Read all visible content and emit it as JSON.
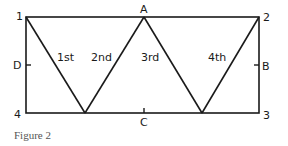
{
  "figure": {
    "caption": "Figure 2",
    "colors": {
      "stroke": "#1a1a1a",
      "caption": "#555555",
      "background": "#ffffff"
    },
    "corners": [
      {
        "label": "1",
        "x": 26,
        "y": 17
      },
      {
        "label": "2",
        "x": 259,
        "y": 17
      },
      {
        "label": "3",
        "x": 259,
        "y": 113
      },
      {
        "label": "4",
        "x": 26,
        "y": 113
      }
    ],
    "midpoints": [
      {
        "label": "A",
        "side": "top"
      },
      {
        "label": "B",
        "side": "right"
      },
      {
        "label": "C",
        "side": "bottom"
      },
      {
        "label": "D",
        "side": "left"
      }
    ],
    "strokes": [
      {
        "label": "1st"
      },
      {
        "label": "2nd"
      },
      {
        "label": "3rd"
      },
      {
        "label": "4th"
      }
    ],
    "zigzag_points": [
      [
        26,
        17
      ],
      [
        85,
        113
      ],
      [
        144,
        17
      ],
      [
        202,
        113
      ],
      [
        259,
        17
      ]
    ]
  }
}
